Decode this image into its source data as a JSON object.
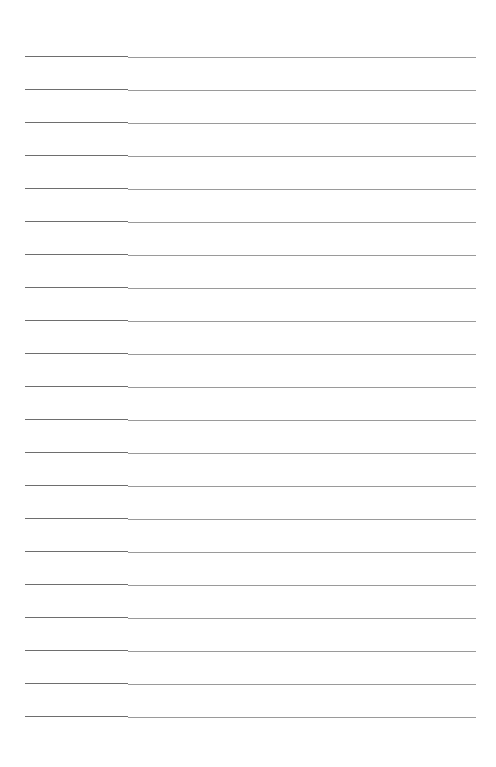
{
  "page": {
    "type": "blank ruled form",
    "line_count": 21,
    "first_line_y": 56,
    "line_spacing": 33,
    "line_left_x": 25,
    "column_split_x": 128,
    "line_right_x": 476
  },
  "colors": {
    "background": "#ffffff",
    "left_column_line": "#6e6e6e",
    "right_column_line": "#9a9a9a"
  }
}
